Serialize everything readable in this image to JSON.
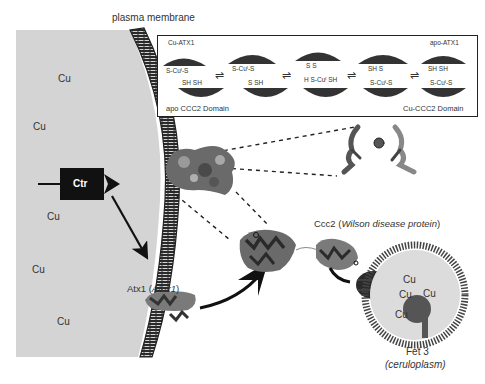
{
  "labels": {
    "plasma_membrane": "plasma membrane",
    "ctr": "Ctr",
    "atx1": "Atx1 (",
    "atx1_italic": "Atox1",
    "atx1_close": ")",
    "ccc2": "Ccc2 (",
    "ccc2_italic": "Wilson disease protein",
    "ccc2_close": ")",
    "fet3": "Fet 3",
    "fet3_sub": "(ceruloplasm)"
  },
  "outside_cu": [
    "Cu",
    "Cu",
    "Cu",
    "Cu",
    "Cu",
    "Cu"
  ],
  "vesicle_cu": [
    "Cu",
    "Cu",
    "Cu",
    "Cu"
  ],
  "inset": {
    "top_left": "Cu-ATX1",
    "top_right": "apo-ATX1",
    "bottom_left": "apo CCC2 Domain",
    "bottom_right": "Cu-CCC2 Domain",
    "states": [
      {
        "top": "S-Cuᴵ-S",
        "bottom": "SH   SH"
      },
      {
        "top": "S-Cuᴵ-S",
        "bottom": "S      SH"
      },
      {
        "top": "S      S",
        "bottom": "H S-Cuᴵ  SH"
      },
      {
        "top": "SH    S",
        "bottom": "S-Cuᴵ-S"
      },
      {
        "top": "SH    SH",
        "bottom": "S-Cuᴵ-S"
      }
    ],
    "equilibrium": "⇌"
  },
  "colors": {
    "cytoplasm_gray": "#d4d4d4",
    "membrane_dark": "#2a2a2a",
    "protein_dark": "#3a3a3a",
    "vesicle_fill": "#dcdcdc"
  }
}
